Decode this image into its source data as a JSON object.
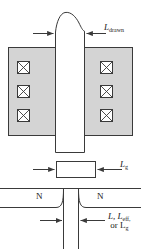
{
  "figure": {
    "colors": {
      "line": "#3a3a3a",
      "fill_gray": "#d4d4d4",
      "fill_white": "#ffffff",
      "background": "#ffffff",
      "text": "#1a1a1a"
    },
    "labels": {
      "l_drawn": {
        "var": "L",
        "sub": "drawn",
        "text": "L drawn"
      },
      "l_g": {
        "var": "L",
        "sub": "g",
        "text": "L g"
      },
      "l_eff_line1": {
        "text": "L, L",
        "sub": "eff,"
      },
      "l_eff_line2": {
        "text": "or L",
        "sub": "g"
      },
      "n_left": "N",
      "n_right": "N"
    },
    "panels": [
      {
        "name": "layout-top-view",
        "description": "Gate polysilicon stripe crossing active area with contact vias",
        "gray_block": {
          "x": 8,
          "y": 47,
          "w": 125,
          "h": 89
        },
        "gate_stripe": {
          "x": 55,
          "y": 10,
          "w": 30,
          "h": 142
        },
        "vias_left": 3,
        "vias_right": 3,
        "via_glyph": "crossed-box"
      },
      {
        "name": "gate-rectangle",
        "description": "Isolated gate cross-section rectangle labeled L_g",
        "rect": {
          "x": 56,
          "y": 161,
          "w": 40,
          "h": 17
        }
      },
      {
        "name": "device-cross-section",
        "description": "Source/drain N regions with junction curves under the gate",
        "regions": [
          "N",
          "N"
        ],
        "channel_gap": {
          "x1": 63,
          "x2": 79
        }
      }
    ],
    "dimension_arrows": [
      {
        "name": "l-drawn-left",
        "direction": "right"
      },
      {
        "name": "l-drawn-right",
        "direction": "left"
      },
      {
        "name": "l-g-left",
        "direction": "right"
      },
      {
        "name": "l-g-right",
        "direction": "left"
      },
      {
        "name": "l-eff-left",
        "direction": "right"
      },
      {
        "name": "l-eff-right",
        "direction": "left"
      }
    ]
  }
}
